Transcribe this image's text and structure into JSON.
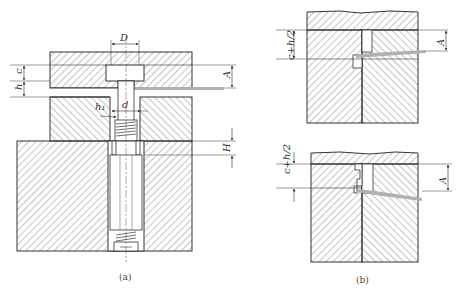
{
  "figure_a": {
    "caption": "(a)",
    "dimensions": {
      "D": "D",
      "d": "d",
      "h1": "h₁",
      "c": "c",
      "h": "h",
      "A": "A",
      "H": "H"
    }
  },
  "figure_b": {
    "caption": "(b)",
    "top": {
      "left_dim": "c+h/2",
      "right_dim": "A"
    },
    "bottom": {
      "left_dim": "c+h/2",
      "right_dim": "A"
    }
  },
  "colors": {
    "line": "#333333",
    "hatch": "#555555",
    "strip": "#b0b0b0"
  }
}
